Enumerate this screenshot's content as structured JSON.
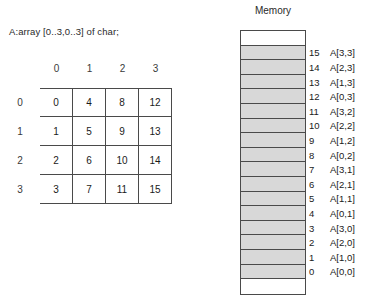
{
  "declaration": "A:array [0..3,0..3] of char;",
  "matrix": {
    "col_headers": [
      "0",
      "1",
      "2",
      "3"
    ],
    "row_headers": [
      "0",
      "1",
      "2",
      "3"
    ],
    "rows": [
      [
        "0",
        "4",
        "8",
        "12"
      ],
      [
        "1",
        "5",
        "9",
        "13"
      ],
      [
        "2",
        "6",
        "10",
        "14"
      ],
      [
        "3",
        "7",
        "11",
        "15"
      ]
    ]
  },
  "memory": {
    "title": "Memory",
    "cells": [
      {
        "index": "",
        "label": "",
        "filled": false
      },
      {
        "index": "15",
        "label": "A[3,3]",
        "filled": true
      },
      {
        "index": "14",
        "label": "A[2,3]",
        "filled": true
      },
      {
        "index": "13",
        "label": "A[1,3]",
        "filled": true
      },
      {
        "index": "12",
        "label": "A[0,3]",
        "filled": true
      },
      {
        "index": "11",
        "label": "A[3,2]",
        "filled": true
      },
      {
        "index": "10",
        "label": "A[2,2]",
        "filled": true
      },
      {
        "index": "9",
        "label": "A[1,2]",
        "filled": true
      },
      {
        "index": "8",
        "label": "A[0,2]",
        "filled": true
      },
      {
        "index": "7",
        "label": "A[3,1]",
        "filled": true
      },
      {
        "index": "6",
        "label": "A[2,1]",
        "filled": true
      },
      {
        "index": "5",
        "label": "A[1,1]",
        "filled": true
      },
      {
        "index": "4",
        "label": "A[0,1]",
        "filled": true
      },
      {
        "index": "3",
        "label": "A[3,0]",
        "filled": true
      },
      {
        "index": "2",
        "label": "A[2,0]",
        "filled": true
      },
      {
        "index": "1",
        "label": "A[1,0]",
        "filled": true
      },
      {
        "index": "0",
        "label": "A[0,0]",
        "filled": true
      },
      {
        "index": "",
        "label": "",
        "filled": false
      }
    ]
  },
  "colors": {
    "cell_fill": "#d8d8d8",
    "border": "#4a4a4a",
    "background": "#ffffff",
    "text": "#1a1a1a"
  }
}
